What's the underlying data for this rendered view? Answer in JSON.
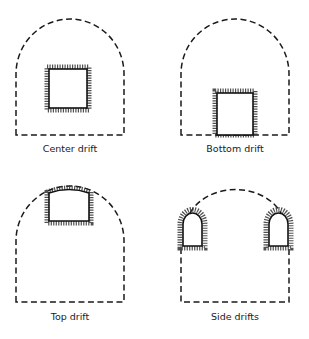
{
  "figure": {
    "panels": [
      {
        "id": "center",
        "label": "Center drift"
      },
      {
        "id": "bottom",
        "label": "Bottom drift"
      },
      {
        "id": "top",
        "label": "Top drift"
      },
      {
        "id": "side",
        "label": "Side drifts"
      }
    ],
    "colors": {
      "line": "#1a1a1a",
      "background": "#ffffff"
    }
  }
}
